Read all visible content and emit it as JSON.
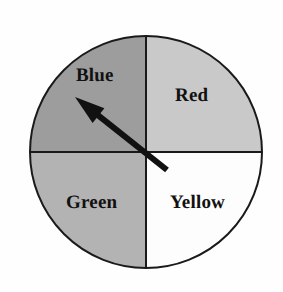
{
  "figure": {
    "name": "spinner-wheel",
    "background_color": "#fefefe"
  },
  "spinner": {
    "center": {
      "x": 146,
      "y": 152
    },
    "radius": 116,
    "outline_color": "#1a1a1a",
    "outline_width": 2,
    "divider_color": "#1a1a1a",
    "divider_width": 2,
    "sectors": [
      {
        "label": "Red",
        "position": "top-right",
        "start_angle_deg": 0,
        "end_angle_deg": 90,
        "fill": "#c9c9c9"
      },
      {
        "label": "Blue",
        "position": "top-left",
        "start_angle_deg": 90,
        "end_angle_deg": 180,
        "fill": "#9d9d9d"
      },
      {
        "label": "Green",
        "position": "bottom-left",
        "start_angle_deg": 180,
        "end_angle_deg": 270,
        "fill": "#b3b3b3"
      },
      {
        "label": "Yellow",
        "position": "bottom-right",
        "start_angle_deg": 270,
        "end_angle_deg": 360,
        "fill": "#fdfdfd"
      }
    ]
  },
  "pointer": {
    "name": "spinner-arrow",
    "color": "#111111",
    "tip": {
      "x": 75,
      "y": 97
    },
    "tail": {
      "x": 167,
      "y": 170
    },
    "points_to": "Blue",
    "shaft_width": 6,
    "head_length": 30,
    "head_width": 19
  }
}
